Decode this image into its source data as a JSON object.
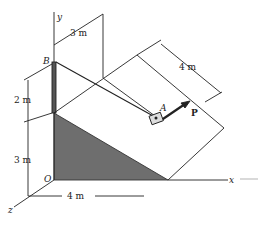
{
  "labels": {
    "y_axis": "y",
    "x_axis": "x",
    "z_axis": "z",
    "origin": "O",
    "point_b": "B",
    "point_a": "A",
    "force": "P"
  },
  "dimensions": {
    "top_offset": "3 m",
    "plane_width": "4 m",
    "pole_height": "2 m",
    "wall_height": "3 m",
    "base_length": "4 m"
  },
  "colors": {
    "line": "#222222",
    "shade": "#6e6e6e",
    "background": "#ffffff"
  }
}
